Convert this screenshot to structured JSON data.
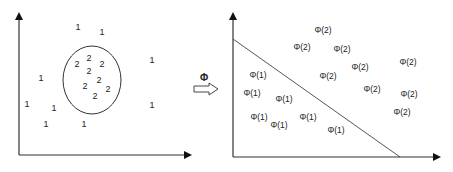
{
  "transform_label": "Φ",
  "left_panel": {
    "description": "Input space: class 1 points surround class 2 points enclosed by an ellipse",
    "class1_label": "1",
    "class2_label": "2",
    "class1_points": [
      [
        78,
        28
      ],
      [
        102,
        33
      ],
      [
        152,
        61
      ],
      [
        41,
        79
      ],
      [
        27,
        105
      ],
      [
        54,
        109
      ],
      [
        152,
        106
      ],
      [
        46,
        125
      ],
      [
        84,
        125
      ]
    ],
    "class2_points": [
      [
        77,
        65
      ],
      [
        89,
        59
      ],
      [
        102,
        65
      ],
      [
        89,
        72
      ],
      [
        85,
        87
      ],
      [
        99,
        81
      ],
      [
        108,
        90
      ],
      [
        95,
        97
      ]
    ],
    "boundary": {
      "type": "ellipse",
      "cx": 92,
      "cy": 80,
      "rx": 29,
      "ry": 34
    }
  },
  "right_panel": {
    "description": "Feature space: mapped points linearly separable by a straight line",
    "class1_label": "Φ(1)",
    "class2_label": "Φ(2)",
    "class1_points": [
      [
        258,
        76
      ],
      [
        252,
        94
      ],
      [
        284,
        100
      ],
      [
        259,
        118
      ],
      [
        279,
        126
      ],
      [
        308,
        118
      ],
      [
        336,
        131
      ]
    ],
    "class2_points": [
      [
        323,
        31
      ],
      [
        302,
        48
      ],
      [
        342,
        50
      ],
      [
        360,
        68
      ],
      [
        408,
        63
      ],
      [
        328,
        77
      ],
      [
        372,
        90
      ],
      [
        409,
        95
      ],
      [
        402,
        113
      ]
    ],
    "boundary": {
      "type": "line",
      "x1": 233,
      "y1": 39,
      "x2": 400,
      "y2": 157
    }
  },
  "labels": {
    "l1": "1",
    "l2": "2",
    "p1": "Φ(1)",
    "p2": "Φ(2)"
  }
}
